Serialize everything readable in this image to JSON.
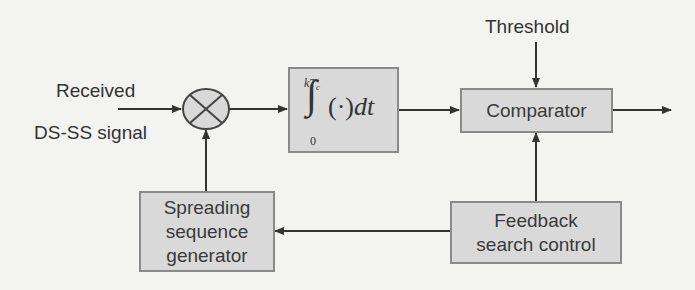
{
  "diagram": {
    "input_label_line1": "Received",
    "input_label_line2": "DS-SS signal",
    "threshold_label": "Threshold",
    "multiplier_symbol": "⊗",
    "integrator": {
      "upper_limit": "kT",
      "upper_limit_sub": "c",
      "lower_limit": "0",
      "integral_sign": "∫",
      "body": "(·)",
      "differential": "dt"
    },
    "blocks": {
      "comparator": "Comparator",
      "spreading_line1": "Spreading",
      "spreading_line2": "sequence",
      "spreading_line3": "generator",
      "feedback_line1": "Feedback",
      "feedback_line2": "search control"
    },
    "colors": {
      "block_fill": "#d9d9d9",
      "block_border": "#8a8a8a",
      "wire": "#333333",
      "background": "#f3f3f1"
    }
  }
}
